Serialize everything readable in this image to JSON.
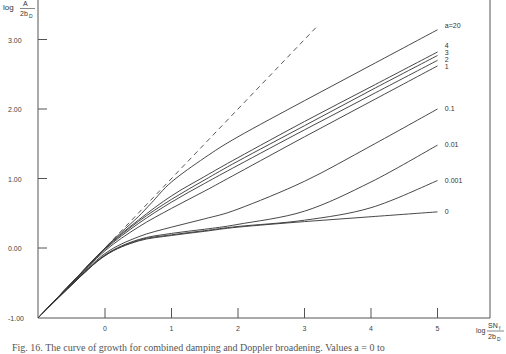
{
  "chart_data": {
    "type": "line",
    "title": "",
    "xlabel": "log SN_f / 2b_D",
    "ylabel": "log A / 2b_D",
    "x_ticks": [
      0,
      1,
      2,
      3,
      4,
      5
    ],
    "x_tick_labels": [
      "0",
      "1",
      "2",
      "3",
      "4",
      "5"
    ],
    "y_ticks": [
      -1,
      0,
      1,
      2,
      3
    ],
    "y_tick_labels": [
      "-1.00",
      "0.00",
      "1.00",
      "2.00",
      "3.00"
    ],
    "xlim": [
      -1.0,
      5.8
    ],
    "ylim": [
      -1.0,
      3.4
    ],
    "grid": false,
    "legend_position": "inline labels at right end of curves",
    "series": [
      {
        "name": "a=20",
        "label": "a=20",
        "x": [
          -1.0,
          -0.5,
          0,
          0.25,
          0.5,
          0.7,
          1.0,
          1.5,
          2.0,
          3.0,
          4.0,
          5.0
        ],
        "y": [
          -1.0,
          -0.5,
          0.0,
          0.23,
          0.45,
          0.65,
          0.95,
          1.3,
          1.6,
          2.12,
          2.63,
          3.14
        ]
      },
      {
        "name": "a=4",
        "label": "4",
        "x": [
          -1.0,
          -0.5,
          0,
          0.5,
          1.0,
          1.5,
          2.0,
          3.0,
          4.0,
          5.0
        ],
        "y": [
          -1.0,
          -0.5,
          0.0,
          0.4,
          0.75,
          1.03,
          1.3,
          1.82,
          2.32,
          2.82
        ]
      },
      {
        "name": "a=3",
        "label": "3",
        "x": [
          -1.0,
          -0.5,
          0,
          0.5,
          1.0,
          1.5,
          2.0,
          3.0,
          4.0,
          5.0
        ],
        "y": [
          -1.0,
          -0.5,
          -0.01,
          0.38,
          0.7,
          0.98,
          1.25,
          1.76,
          2.27,
          2.77
        ]
      },
      {
        "name": "a=2",
        "label": "2",
        "x": [
          -1.0,
          -0.5,
          0,
          0.5,
          1.0,
          1.5,
          2.0,
          3.0,
          4.0,
          5.0
        ],
        "y": [
          -1.0,
          -0.5,
          -0.02,
          0.35,
          0.66,
          0.93,
          1.19,
          1.7,
          2.2,
          2.7
        ]
      },
      {
        "name": "a=1",
        "label": "1",
        "x": [
          -1.0,
          -0.5,
          0,
          0.5,
          1.0,
          1.5,
          2.0,
          3.0,
          4.0,
          5.0
        ],
        "y": [
          -1.0,
          -0.51,
          -0.04,
          0.3,
          0.57,
          0.82,
          1.08,
          1.6,
          2.11,
          2.62
        ]
      },
      {
        "name": "a=0.1",
        "label": "0.1",
        "x": [
          -1.0,
          -0.5,
          0,
          0.5,
          1.0,
          1.5,
          2.0,
          3.0,
          4.0,
          5.0
        ],
        "y": [
          -1.0,
          -0.52,
          -0.08,
          0.16,
          0.3,
          0.42,
          0.56,
          0.96,
          1.47,
          2.0
        ]
      },
      {
        "name": "a=0.01",
        "label": "0.01",
        "x": [
          -1.0,
          -0.5,
          0,
          0.5,
          1.0,
          1.5,
          2.0,
          3.0,
          4.0,
          5.0
        ],
        "y": [
          -1.0,
          -0.53,
          -0.1,
          0.12,
          0.21,
          0.27,
          0.34,
          0.53,
          0.95,
          1.48
        ]
      },
      {
        "name": "a=0.001",
        "label": "0.001",
        "x": [
          -1.0,
          -0.5,
          0,
          0.5,
          1.0,
          1.5,
          2.0,
          3.0,
          4.0,
          5.0
        ],
        "y": [
          -1.0,
          -0.53,
          -0.11,
          0.11,
          0.19,
          0.25,
          0.31,
          0.4,
          0.58,
          0.97
        ]
      },
      {
        "name": "a=0",
        "label": "0",
        "x": [
          -1.0,
          -0.5,
          0,
          0.5,
          1.0,
          1.5,
          2.0,
          3.0,
          4.0,
          5.0
        ],
        "y": [
          -1.0,
          -0.53,
          -0.11,
          0.1,
          0.18,
          0.24,
          0.3,
          0.38,
          0.45,
          0.52
        ]
      },
      {
        "name": "linear (dashed)",
        "label": "",
        "style": "dashed",
        "x": [
          -1.0,
          3.2
        ],
        "y": [
          -1.0,
          3.2
        ]
      }
    ],
    "annotations": [
      {
        "text": "a=20",
        "x": 5.05,
        "y": 3.2
      },
      {
        "text": "4",
        "x": 5.05,
        "y": 2.9
      },
      {
        "text": "3",
        "x": 5.05,
        "y": 2.8
      },
      {
        "text": "2",
        "x": 5.05,
        "y": 2.71
      },
      {
        "text": "1",
        "x": 5.05,
        "y": 2.6
      },
      {
        "text": "0.1",
        "x": 5.05,
        "y": 2.0
      },
      {
        "text": "0.01",
        "x": 5.05,
        "y": 1.48
      },
      {
        "text": "0.001",
        "x": 5.05,
        "y": 0.97
      },
      {
        "text": "0",
        "x": 5.05,
        "y": 0.52
      }
    ]
  },
  "axes": {
    "y_title_prefix": "log",
    "y_title_num": "A",
    "y_title_den": "2b",
    "y_title_den_sub": "D",
    "x_title_prefix": "log",
    "x_title_num": "SN",
    "x_title_num_sub": "f",
    "x_title_den": "2b",
    "x_title_den_sub": "D"
  },
  "caption": "Fig. 16.  The curve of growth for combined damping and Doppler broadening. Values a = 0 to"
}
